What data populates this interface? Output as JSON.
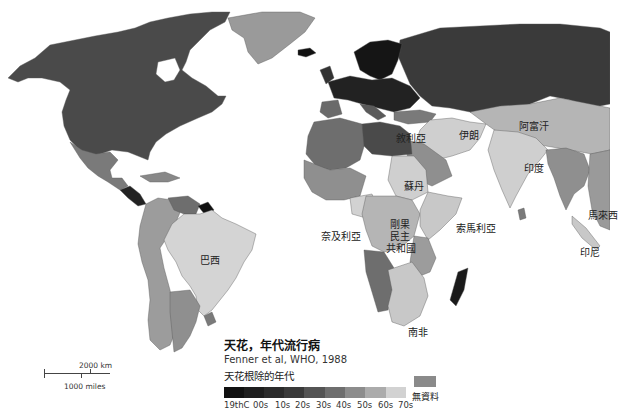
{
  "legend": {
    "title": "天花，年代流行病",
    "source": "Fenner et al, WHO, 1988",
    "subtitle": "天花根除的年代",
    "scale": [
      {
        "label": "19thC",
        "color": "#111111"
      },
      {
        "label": "00s",
        "color": "#1e1e1e"
      },
      {
        "label": "10s",
        "color": "#2b2b2b"
      },
      {
        "label": "20s",
        "color": "#3a3a3a"
      },
      {
        "label": "30s",
        "color": "#545454"
      },
      {
        "label": "40s",
        "color": "#6e6e6e"
      },
      {
        "label": "50s",
        "color": "#8c8c8c"
      },
      {
        "label": "60s",
        "color": "#ababab"
      },
      {
        "label": "70s",
        "color": "#d2d2d2"
      }
    ],
    "no_data": {
      "label": "無資料",
      "color": "#8a8a8a"
    }
  },
  "scale_bar": {
    "km_label": "2000 km",
    "miles_label": "1000 miles"
  },
  "country_labels": {
    "syria": "敘利亞",
    "iran": "伊朗",
    "afghanistan": "阿富汗",
    "india": "印度",
    "sudan": "蘇丹",
    "nigeria": "奈及利亞",
    "drc": "剛果\n民主\n共和國",
    "drc_line1": "剛果",
    "drc_line2": "民主",
    "drc_line3": "共和國",
    "somalia": "索馬利亞",
    "malaysia": "馬來西",
    "indonesia": "印尼",
    "brazil": "巴西",
    "south_africa": "南非"
  },
  "colors": {
    "background": "#ffffff",
    "north_america": "#4a4a4a",
    "greenland": "#9a9a9a",
    "europe_north": "#151515",
    "russia": "#3a3a3a",
    "mexico": "#7a7a7a",
    "south_america": "#9c9c9c",
    "brazil": "#d4d4d4",
    "africa_mid": "#8f8f8f",
    "africa_light": "#c8c8c8",
    "middle_east": "#cfcfcf",
    "asia_light": "#b5b5b5",
    "libya_egypt": "#4a4a4a",
    "madagascar": "#1a1a1a"
  }
}
